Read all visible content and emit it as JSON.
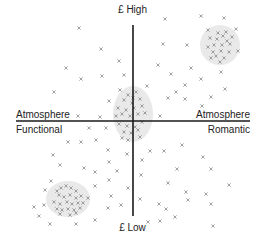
{
  "diagram": {
    "type": "perceptual-map",
    "axes": {
      "vertical": {
        "top_label": "£ High",
        "bottom_label": "£ Low"
      },
      "horizontal": {
        "left_label_top": "Atmosphere",
        "left_label_bottom": "Functional",
        "right_label_top": "Atmosphere",
        "right_label_bottom": "Romantic"
      }
    },
    "colors": {
      "axis": "#1a1a1a",
      "marker": "#8a8a8a",
      "cluster_fill": "#e9e9e9",
      "text": "#222222"
    },
    "clusters": [
      {
        "name": "high-price-romantic",
        "cx": 220,
        "cy": 45,
        "rx": 20,
        "ry": 20
      },
      {
        "name": "centre",
        "cx": 133,
        "cy": 114,
        "rx": 20,
        "ry": 28
      },
      {
        "name": "low-price-functional",
        "cx": 68,
        "cy": 199,
        "rx": 22,
        "ry": 18
      }
    ],
    "markers": [
      [
        79,
        28
      ],
      [
        165,
        19
      ],
      [
        201,
        16
      ],
      [
        224,
        18
      ],
      [
        236,
        29
      ],
      [
        101,
        49
      ],
      [
        119,
        61
      ],
      [
        66,
        68
      ],
      [
        81,
        79
      ],
      [
        102,
        76
      ],
      [
        124,
        75
      ],
      [
        54,
        92
      ],
      [
        163,
        44
      ],
      [
        187,
        45
      ],
      [
        238,
        51
      ],
      [
        158,
        65
      ],
      [
        191,
        68
      ],
      [
        171,
        74
      ],
      [
        147,
        86
      ],
      [
        176,
        92
      ],
      [
        221,
        72
      ],
      [
        201,
        79
      ],
      [
        185,
        99
      ],
      [
        211,
        97
      ],
      [
        202,
        106
      ],
      [
        168,
        98
      ],
      [
        185,
        85
      ],
      [
        225,
        89
      ],
      [
        109,
        101
      ],
      [
        100,
        117
      ],
      [
        78,
        116
      ],
      [
        160,
        116
      ],
      [
        89,
        128
      ],
      [
        106,
        128
      ],
      [
        68,
        142
      ],
      [
        81,
        142
      ],
      [
        96,
        140
      ],
      [
        108,
        150
      ],
      [
        53,
        155
      ],
      [
        127,
        154
      ],
      [
        60,
        165
      ],
      [
        84,
        168
      ],
      [
        142,
        160
      ],
      [
        164,
        151
      ],
      [
        203,
        157
      ],
      [
        182,
        145
      ],
      [
        150,
        151
      ],
      [
        109,
        162
      ],
      [
        95,
        172
      ],
      [
        117,
        171
      ],
      [
        141,
        175
      ],
      [
        177,
        169
      ],
      [
        168,
        183
      ],
      [
        211,
        169
      ],
      [
        229,
        185
      ],
      [
        51,
        181
      ],
      [
        109,
        180
      ],
      [
        95,
        186
      ],
      [
        111,
        196
      ],
      [
        128,
        188
      ],
      [
        45,
        190
      ],
      [
        88,
        198
      ],
      [
        108,
        208
      ],
      [
        121,
        205
      ],
      [
        34,
        207
      ],
      [
        44,
        205
      ],
      [
        39,
        216
      ],
      [
        50,
        224
      ],
      [
        76,
        224
      ],
      [
        95,
        220
      ],
      [
        140,
        199
      ],
      [
        159,
        204
      ],
      [
        186,
        192
      ],
      [
        166,
        209
      ],
      [
        206,
        194
      ],
      [
        211,
        204
      ],
      [
        188,
        200
      ],
      [
        148,
        222
      ],
      [
        160,
        221
      ],
      [
        175,
        217
      ],
      [
        213,
        226
      ]
    ],
    "cluster_markers": [
      [
        208,
        30
      ],
      [
        218,
        33
      ],
      [
        210,
        38
      ],
      [
        217,
        39
      ],
      [
        223,
        36
      ],
      [
        227,
        41
      ],
      [
        214,
        45
      ],
      [
        222,
        45
      ],
      [
        230,
        44
      ],
      [
        208,
        47
      ],
      [
        213,
        52
      ],
      [
        221,
        51
      ],
      [
        229,
        52
      ],
      [
        216,
        56
      ],
      [
        224,
        58
      ],
      [
        211,
        58
      ],
      [
        226,
        32
      ],
      [
        220,
        62
      ],
      [
        232,
        37
      ],
      [
        120,
        90
      ],
      [
        128,
        95
      ],
      [
        136,
        92
      ],
      [
        140,
        99
      ],
      [
        124,
        100
      ],
      [
        132,
        103
      ],
      [
        118,
        108
      ],
      [
        126,
        110
      ],
      [
        134,
        108
      ],
      [
        142,
        106
      ],
      [
        116,
        116
      ],
      [
        122,
        114
      ],
      [
        130,
        116
      ],
      [
        138,
        114
      ],
      [
        145,
        113
      ],
      [
        119,
        124
      ],
      [
        127,
        126
      ],
      [
        135,
        127
      ],
      [
        142,
        122
      ],
      [
        124,
        132
      ],
      [
        131,
        133
      ],
      [
        138,
        130
      ],
      [
        140,
        137
      ],
      [
        122,
        138
      ],
      [
        128,
        140
      ],
      [
        133,
        98
      ],
      [
        57,
        191
      ],
      [
        61,
        188
      ],
      [
        66,
        186
      ],
      [
        71,
        188
      ],
      [
        76,
        191
      ],
      [
        59,
        195
      ],
      [
        64,
        197
      ],
      [
        70,
        195
      ],
      [
        76,
        198
      ],
      [
        81,
        196
      ],
      [
        54,
        202
      ],
      [
        60,
        204
      ],
      [
        67,
        202
      ],
      [
        72,
        204
      ],
      [
        78,
        203
      ],
      [
        83,
        203
      ],
      [
        57,
        209
      ],
      [
        62,
        210
      ],
      [
        68,
        209
      ],
      [
        74,
        210
      ],
      [
        80,
        208
      ],
      [
        60,
        214
      ],
      [
        70,
        215
      ],
      [
        76,
        213
      ]
    ]
  }
}
